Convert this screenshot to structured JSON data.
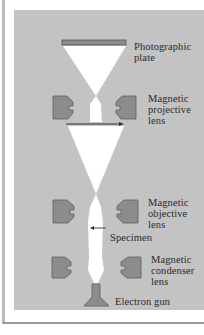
{
  "labels": {
    "photographic_plate": [
      "Photographic",
      "plate"
    ],
    "projective_lens": [
      "Magnetic",
      "projective",
      "lens"
    ],
    "objective_lens": [
      "Magnetic",
      "objective",
      "lens"
    ],
    "specimen": "Specimen",
    "condenser_lens": [
      "Magnetic",
      "condenser",
      "lens"
    ],
    "electron_gun": "Electron gun"
  },
  "colors": {
    "panel": "#c3c3c3",
    "beam": "#ffffff",
    "lens": "#8c8c8c",
    "lens_outline": "#5e5e5e",
    "plate": "#8a8a8a",
    "arrow": "#333333"
  }
}
